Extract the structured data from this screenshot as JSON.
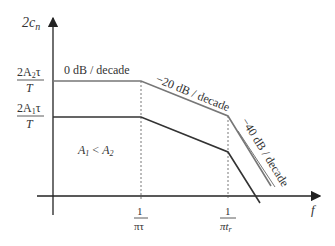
{
  "diagram": {
    "y_axis_label": "2c",
    "y_axis_label_sub": "n",
    "x_axis_label": "f",
    "y_ticks": [
      {
        "num_pre": "2A",
        "sub": "2",
        "num_post": "τ",
        "den": "T"
      },
      {
        "num_pre": "2A",
        "sub": "1",
        "num_post": "τ",
        "den": "T"
      }
    ],
    "x_ticks": [
      {
        "num": "1",
        "den": "πτ",
        "den_sub": ""
      },
      {
        "num": "1",
        "den": "πt",
        "den_sub": "r"
      }
    ],
    "slope_labels": {
      "flat": "0 dB / decade",
      "mid": "−20 dB / decade",
      "steep": "−40 dB / decade"
    },
    "condition": {
      "a": "A",
      "a_sub": "1",
      "op": " < ",
      "b": "A",
      "b_sub": "2"
    },
    "colors": {
      "axis": "#222222",
      "upper": "#777777",
      "lower": "#333333",
      "guide": "#555555"
    }
  }
}
